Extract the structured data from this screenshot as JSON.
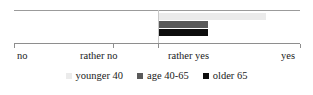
{
  "chart_data": {
    "type": "bar",
    "orientation": "horizontal",
    "title": "",
    "xlabel": "",
    "ylabel": "",
    "categories": [
      ""
    ],
    "tick_labels": [
      "no",
      "rather no",
      "rather yes",
      "yes"
    ],
    "xlim": [
      0,
      3
    ],
    "grid": true,
    "gridlines_at": [
      "rather yes"
    ],
    "legend_position": "bottom",
    "series": [
      {
        "name": "younger 40",
        "color": "#ebebeb",
        "start": "rather yes",
        "values": [
          2.38
        ]
      },
      {
        "name": "age 40-65",
        "color": "#5a5a5a",
        "start": "rather yes",
        "values": [
          2.17
        ]
      },
      {
        "name": "older 65",
        "color": "#0d0d0d",
        "start": "rather yes",
        "values": [
          2.17
        ]
      }
    ]
  },
  "axis": {
    "ticks": [
      {
        "label": "no",
        "x": 14
      },
      {
        "label": "rather no",
        "x": 113
      },
      {
        "label": "rather yes",
        "x": 158
      },
      {
        "label": "yes",
        "x": 300
      }
    ]
  },
  "bars": [
    {
      "name": "younger 40",
      "left": 158,
      "width": 108,
      "top": 3,
      "color": "#ebebeb"
    },
    {
      "name": "age 40-65",
      "left": 158,
      "width": 50,
      "top": 11,
      "color": "#5a5a5a"
    },
    {
      "name": "older 65",
      "left": 158,
      "width": 50,
      "top": 19,
      "color": "#0d0d0d"
    }
  ],
  "legend": {
    "items": [
      {
        "label": "younger 40",
        "color": "#ebebeb"
      },
      {
        "label": "age 40-65",
        "color": "#5a5a5a"
      },
      {
        "label": "older 65",
        "color": "#0d0d0d"
      }
    ]
  }
}
